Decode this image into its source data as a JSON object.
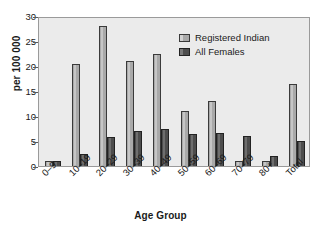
{
  "chart_data": {
    "type": "bar",
    "title": "",
    "xlabel": "Age Group",
    "ylabel": "per 100 000",
    "ylim": [
      0,
      30
    ],
    "yticks": [
      0,
      5,
      10,
      15,
      20,
      25,
      30
    ],
    "ytick_labels": [
      "0",
      "5",
      "10",
      "15",
      "20",
      "25",
      "30"
    ],
    "grid": false,
    "legend_position": "top-center",
    "categories": [
      "0–9",
      "10–19",
      "20–29",
      "30–39",
      "40–49",
      "50–59",
      "60–69",
      "70–79",
      "80+",
      "Total"
    ],
    "series": [
      {
        "name": "Registered Indian",
        "color": "#a9a9a9",
        "values": [
          1.0,
          20.4,
          28.0,
          21.0,
          22.5,
          11.0,
          13.1,
          1.0,
          1.0,
          16.5
        ]
      },
      {
        "name": "All Females",
        "color": "#4d4d4d",
        "values": [
          1.0,
          2.5,
          5.8,
          7.0,
          7.5,
          6.5,
          6.6,
          6.0,
          2.0,
          5.0
        ]
      }
    ]
  },
  "legend": {
    "items": [
      {
        "label": "Registered Indian",
        "swatch": "light-gray-swatch"
      },
      {
        "label": "All Females",
        "swatch": "dark-gray-swatch"
      }
    ]
  },
  "axes": {
    "y_title": "per 100 000",
    "x_title": "Age Group"
  },
  "colors": {
    "plot_background": "#ebebeb",
    "series_light": "#a9a9a9",
    "series_dark": "#4d4d4d",
    "axis": "#5a5a5a",
    "text": "#1a1a1a"
  }
}
